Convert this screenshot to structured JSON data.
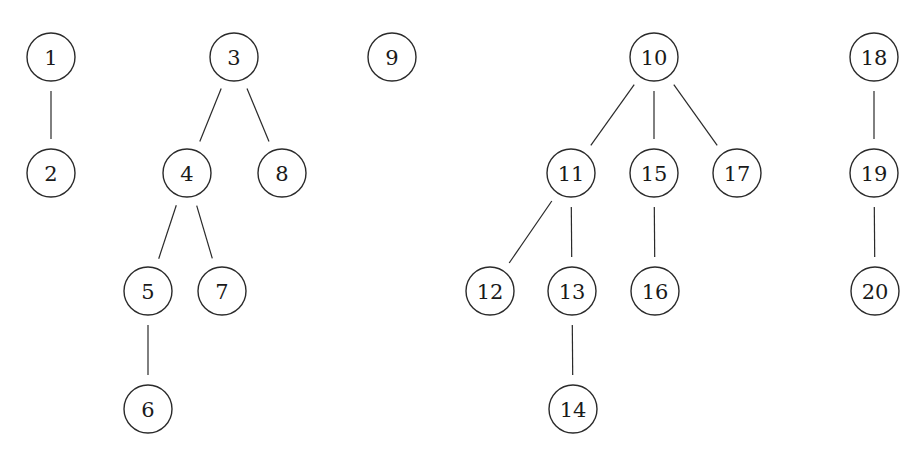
{
  "diagram": {
    "type": "forest",
    "stroke_color": "#2a2a2a",
    "node_radius": 24,
    "edge_gap": 10,
    "nodes": [
      {
        "id": "1",
        "label": "1",
        "x": 51,
        "y": 57
      },
      {
        "id": "2",
        "label": "2",
        "x": 51,
        "y": 173
      },
      {
        "id": "3",
        "label": "3",
        "x": 234,
        "y": 57
      },
      {
        "id": "4",
        "label": "4",
        "x": 187,
        "y": 173
      },
      {
        "id": "8",
        "label": "8",
        "x": 282,
        "y": 173
      },
      {
        "id": "5",
        "label": "5",
        "x": 148,
        "y": 291
      },
      {
        "id": "7",
        "label": "7",
        "x": 222,
        "y": 291
      },
      {
        "id": "6",
        "label": "6",
        "x": 148,
        "y": 409
      },
      {
        "id": "9",
        "label": "9",
        "x": 392,
        "y": 57
      },
      {
        "id": "10",
        "label": "10",
        "x": 654,
        "y": 57
      },
      {
        "id": "11",
        "label": "11",
        "x": 571,
        "y": 173
      },
      {
        "id": "15",
        "label": "15",
        "x": 654,
        "y": 173
      },
      {
        "id": "17",
        "label": "17",
        "x": 737,
        "y": 173
      },
      {
        "id": "12",
        "label": "12",
        "x": 490,
        "y": 291
      },
      {
        "id": "13",
        "label": "13",
        "x": 572,
        "y": 291
      },
      {
        "id": "16",
        "label": "16",
        "x": 655,
        "y": 291
      },
      {
        "id": "14",
        "label": "14",
        "x": 573,
        "y": 409
      },
      {
        "id": "18",
        "label": "18",
        "x": 874,
        "y": 57
      },
      {
        "id": "19",
        "label": "19",
        "x": 874,
        "y": 173
      },
      {
        "id": "20",
        "label": "20",
        "x": 875,
        "y": 291
      }
    ],
    "edges": [
      {
        "from": "1",
        "to": "2"
      },
      {
        "from": "3",
        "to": "4"
      },
      {
        "from": "3",
        "to": "8"
      },
      {
        "from": "4",
        "to": "5"
      },
      {
        "from": "4",
        "to": "7"
      },
      {
        "from": "5",
        "to": "6"
      },
      {
        "from": "10",
        "to": "11"
      },
      {
        "from": "10",
        "to": "15"
      },
      {
        "from": "10",
        "to": "17"
      },
      {
        "from": "11",
        "to": "12"
      },
      {
        "from": "11",
        "to": "13"
      },
      {
        "from": "13",
        "to": "14"
      },
      {
        "from": "15",
        "to": "16"
      },
      {
        "from": "18",
        "to": "19"
      },
      {
        "from": "19",
        "to": "20"
      }
    ],
    "trees": [
      {
        "root": "1",
        "nodes": [
          "1",
          "2"
        ]
      },
      {
        "root": "3",
        "nodes": [
          "3",
          "4",
          "5",
          "6",
          "7",
          "8"
        ]
      },
      {
        "root": "9",
        "nodes": [
          "9"
        ]
      },
      {
        "root": "10",
        "nodes": [
          "10",
          "11",
          "12",
          "13",
          "14",
          "15",
          "16",
          "17"
        ]
      },
      {
        "root": "18",
        "nodes": [
          "18",
          "19",
          "20"
        ]
      }
    ]
  }
}
